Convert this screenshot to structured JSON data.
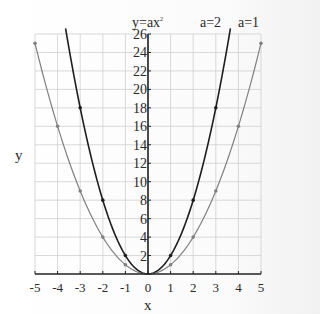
{
  "chart_data": {
    "type": "line",
    "xlabel": "x",
    "ylabel": "y",
    "xlim": [
      -5,
      5
    ],
    "ylim": [
      0,
      26
    ],
    "x_ticks": [
      -5,
      -4,
      -3,
      -2,
      -1,
      0,
      1,
      2,
      3,
      4,
      5
    ],
    "y_ticks": [
      2,
      4,
      6,
      8,
      10,
      12,
      14,
      16,
      18,
      20,
      22,
      24,
      26
    ],
    "grid": true,
    "legend_position": "top-right",
    "series": [
      {
        "name": "a=2",
        "a": 2,
        "color": "#1e1e1e",
        "points": [
          [
            -3,
            18
          ],
          [
            -2,
            8
          ],
          [
            -1,
            2
          ],
          [
            0,
            0
          ],
          [
            1,
            2
          ],
          [
            2,
            8
          ],
          [
            3,
            18
          ]
        ]
      },
      {
        "name": "a=1",
        "a": 1,
        "color": "#808080",
        "points": [
          [
            -5,
            25
          ],
          [
            -4,
            16
          ],
          [
            -3,
            9
          ],
          [
            -2,
            4
          ],
          [
            -1,
            1
          ],
          [
            0,
            0
          ],
          [
            1,
            1
          ],
          [
            2,
            4
          ],
          [
            3,
            9
          ],
          [
            4,
            16
          ],
          [
            5,
            25
          ]
        ]
      }
    ]
  },
  "labels": {
    "title": "y=ax",
    "title_sup": "2",
    "legend_a2": "a=2",
    "legend_a1": "a=1",
    "xlabel": "x",
    "ylabel": "y"
  }
}
